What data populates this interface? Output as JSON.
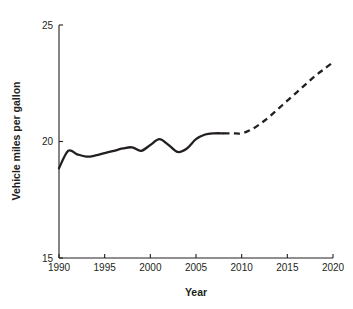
{
  "chart_data": {
    "type": "line",
    "title": "",
    "xlabel": "Year",
    "ylabel": "Vehicle miles per gallon",
    "xlim": [
      1990,
      2020
    ],
    "ylim": [
      15,
      25
    ],
    "xticks": [
      1990,
      1995,
      2000,
      2005,
      2010,
      2015,
      2020
    ],
    "xtick_labels": [
      "1990",
      "1995",
      "2000",
      "2005",
      "2010",
      "2015",
      "2020"
    ],
    "yticks": [
      15,
      20,
      25
    ],
    "ytick_labels": [
      "15",
      "20",
      "25"
    ],
    "grid": false,
    "legend": null,
    "line_color": "#231f20",
    "series": [
      {
        "name": "Historical",
        "style": "solid",
        "x": [
          1990,
          1991,
          1992,
          1993,
          1994,
          1995,
          1996,
          1997,
          1998,
          1999,
          2000,
          2001,
          2002,
          2003,
          2004,
          2005,
          2006,
          2007,
          2008
        ],
        "values": [
          18.85,
          19.6,
          19.45,
          19.35,
          19.4,
          19.5,
          19.6,
          19.7,
          19.75,
          19.6,
          19.85,
          20.1,
          19.85,
          19.55,
          19.7,
          20.1,
          20.3,
          20.35,
          20.35
        ]
      },
      {
        "name": "Projected",
        "style": "dashed",
        "x": [
          2008,
          2009,
          2010,
          2011,
          2012,
          2013,
          2014,
          2015,
          2016,
          2017,
          2018,
          2019,
          2020
        ],
        "values": [
          20.35,
          20.35,
          20.35,
          20.5,
          20.75,
          21.05,
          21.4,
          21.75,
          22.1,
          22.45,
          22.8,
          23.1,
          23.4
        ]
      }
    ]
  },
  "axes": {
    "x_title": "Year",
    "y_title": "Vehicle miles per gallon"
  }
}
